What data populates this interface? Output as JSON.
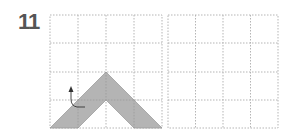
{
  "problem": {
    "number": "11"
  },
  "grids": [
    {
      "name": "left-grid",
      "rows": 4,
      "cols": 4
    },
    {
      "name": "right-grid",
      "rows": 4,
      "cols": 4
    }
  ],
  "colors": {
    "grid_line": "#b5b5b5",
    "shape_fill": "#b0b0b0",
    "shape_stroke": "#999999",
    "number": "#555555",
    "arrow": "#333333"
  }
}
